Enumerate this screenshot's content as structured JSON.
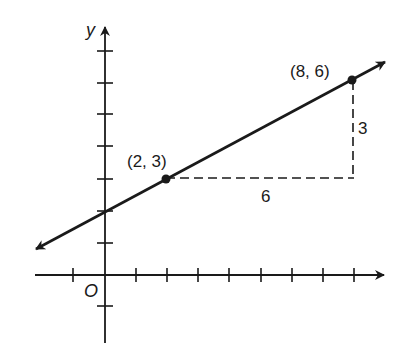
{
  "diagram": {
    "type": "coordinate-plane-line-slope",
    "axes": {
      "x_label": "",
      "y_label": "y",
      "origin_label": "O",
      "x_ticks": [
        -1,
        1,
        2,
        3,
        4,
        5,
        6,
        7,
        8
      ],
      "y_ticks": [
        -1,
        1,
        2,
        3,
        4,
        5,
        6,
        7
      ]
    },
    "line": {
      "equation": "y = 0.5x + 2",
      "slope": 0.5,
      "y_intercept": 2,
      "arrows": "both ends"
    },
    "points": [
      {
        "x": 2,
        "y": 3,
        "label": "(2, 3)"
      },
      {
        "x": 8,
        "y": 6,
        "label": "(8, 6)"
      }
    ],
    "run": {
      "value": 6,
      "label": "6",
      "style": "dashed"
    },
    "rise": {
      "value": 3,
      "label": "3",
      "style": "dashed"
    },
    "colors": {
      "ink": "#1a1a1a",
      "background": "#ffffff"
    }
  }
}
